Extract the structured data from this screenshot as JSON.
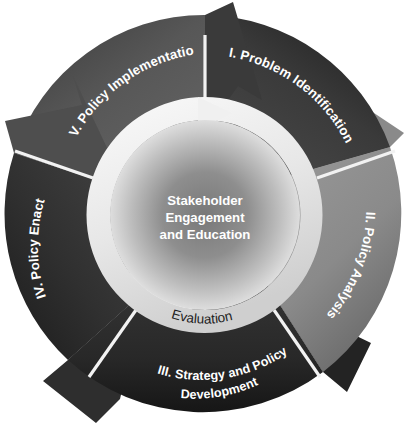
{
  "diagram": {
    "type": "circular-process-cycle",
    "center": {
      "x": 205,
      "y": 215
    },
    "radii": {
      "outer_ring_outer": 200,
      "outer_ring_inner": 118,
      "evaluation_ring_outer": 118,
      "evaluation_ring_inner": 95,
      "hub": 95
    },
    "hub": {
      "line1": "Stakeholder",
      "line2": "Engagement",
      "line3": "and Education",
      "text_color": "#ffffff",
      "fill_center": "#8a8a8a",
      "fill_edge": "#d8d8d8"
    },
    "evaluation_ring": {
      "label": "Evaluation",
      "text_color": "#1d1d1d",
      "fill_light": "#f4f4f4",
      "fill_mid": "#dcdcdc",
      "arrow_position": "top",
      "direction": "clockwise"
    },
    "divider_color": "#f2f2f2",
    "background": "#ffffff",
    "segments": [
      {
        "id": "segment-1",
        "numeral": "I.",
        "label": "I. Problem Identification",
        "label_lines": [
          "I. Problem Identification"
        ],
        "color": "#3b3b3b",
        "color_dark": "#232323",
        "start_angle_deg": -90,
        "end_angle_deg": -18,
        "text_color": "#ffffff"
      },
      {
        "id": "segment-2",
        "numeral": "II.",
        "label": "II. Policy Analysis",
        "label_lines": [
          "II. Policy Analysis"
        ],
        "color": "#8c8c8c",
        "color_dark": "#6d6d6d",
        "start_angle_deg": -18,
        "end_angle_deg": 54,
        "text_color": "#ffffff"
      },
      {
        "id": "segment-3",
        "numeral": "III.",
        "label": "III. Strategy and Policy Development",
        "label_lines": [
          "III. Strategy and Policy",
          "Development"
        ],
        "color": "#2b2b2b",
        "color_dark": "#191919",
        "start_angle_deg": 54,
        "end_angle_deg": 126,
        "text_color": "#ffffff"
      },
      {
        "id": "segment-4",
        "numeral": "IV.",
        "label": "IV. Policy Enactment",
        "label_lines": [
          "IV. Policy Enactment"
        ],
        "color": "#343434",
        "color_dark": "#1f1f1f",
        "start_angle_deg": 126,
        "end_angle_deg": 198,
        "text_color": "#ffffff"
      },
      {
        "id": "segment-5",
        "numeral": "V.",
        "label": "V. Policy Implementation",
        "label_lines": [
          "V. Policy Implementation"
        ],
        "color": "#595959",
        "color_dark": "#3d3d3d",
        "start_angle_deg": 198,
        "end_angle_deg": 270,
        "text_color": "#ffffff"
      }
    ]
  }
}
